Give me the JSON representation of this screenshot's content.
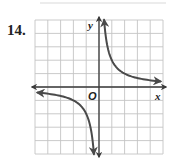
{
  "problem": {
    "number": "14."
  },
  "chart_data": {
    "type": "line",
    "title": "",
    "xlabel": "x",
    "ylabel": "y",
    "origin_label": "O",
    "xlim": [
      -5,
      5
    ],
    "ylim": [
      -5,
      5
    ],
    "grid": true,
    "grid_step": 1,
    "tick_labels": false,
    "legend": null,
    "series": [
      {
        "name": "branch-quadrant-I",
        "equation": "y = 2/x",
        "x": [
          0.4,
          0.5,
          0.75,
          1,
          1.5,
          2,
          3,
          4,
          4.8
        ],
        "y": [
          5,
          4,
          2.67,
          2,
          1.33,
          1,
          0.67,
          0.5,
          0.42
        ],
        "arrows": "both-ends"
      },
      {
        "name": "branch-quadrant-III",
        "equation": "y = 2/x",
        "x": [
          -4.8,
          -4,
          -3,
          -2,
          -1.5,
          -1,
          -0.75,
          -0.5,
          -0.4
        ],
        "y": [
          -0.42,
          -0.5,
          -0.67,
          -1,
          -1.33,
          -2,
          -2.67,
          -4,
          -5
        ],
        "arrows": "both-ends"
      }
    ],
    "asymptotes": {
      "vertical": 0,
      "horizontal": 0
    }
  },
  "colors": {
    "grid": "#c4c4c4",
    "axis": "#3a3a3a",
    "curve": "#4a4a4a",
    "label": "#222222"
  }
}
